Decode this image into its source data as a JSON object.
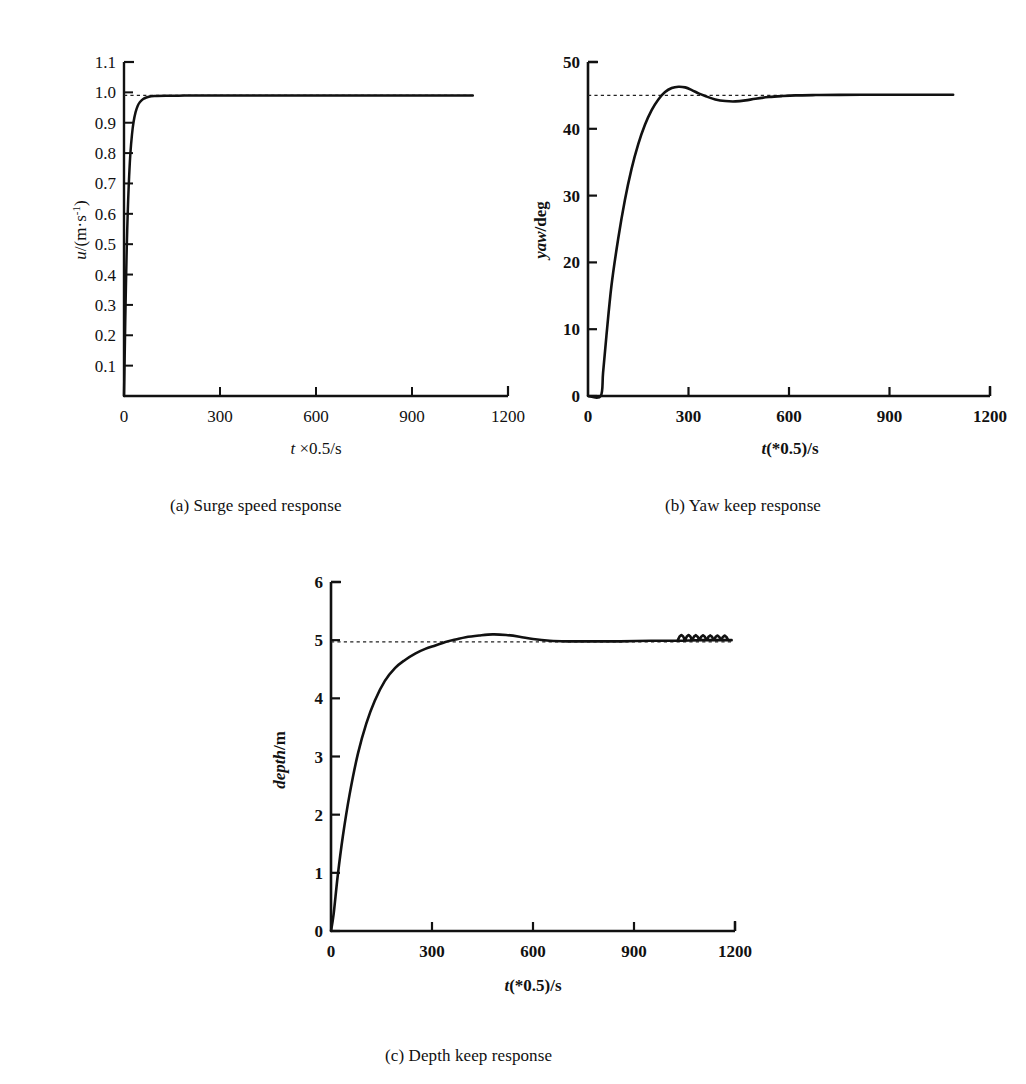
{
  "figure": {
    "background": "#ffffff",
    "ink_color": "#111111"
  },
  "captions": {
    "a": "(a) Surge speed response",
    "b": "(b) Yaw keep response",
    "c": "(c) Depth keep response"
  },
  "panel_a": {
    "ylabel_var": "u",
    "ylabel_unit": "/(m·s",
    "ylabel_exp": "-1",
    "ylabel_close": ")",
    "xlabel_var": "t",
    "xlabel_rest": " ×0.5/s",
    "xticks": [
      "0",
      "300",
      "600",
      "900",
      "1200"
    ],
    "yticks": [
      "0.1",
      "0.2",
      "0.3",
      "0.4",
      "0.5",
      "0.6",
      "0.7",
      "0.8",
      "0.9",
      "1.0",
      "1.1"
    ]
  },
  "panel_b": {
    "ylabel_var": "yaw",
    "ylabel_unit": "/deg",
    "xlabel_var": "t",
    "xlabel_rest": "(*0.5)/s",
    "xticks": [
      "0",
      "300",
      "600",
      "900",
      "1200"
    ],
    "yticks": [
      "0",
      "10",
      "20",
      "30",
      "40",
      "50"
    ]
  },
  "panel_c": {
    "ylabel_var": "depth",
    "ylabel_unit": "/m",
    "xlabel_var": "t",
    "xlabel_rest": "(*0.5)/s",
    "xticks": [
      "0",
      "300",
      "600",
      "900",
      "1200"
    ],
    "yticks": [
      "0",
      "1",
      "2",
      "3",
      "4",
      "5",
      "6"
    ]
  },
  "chart_data": [
    {
      "id": "surge-speed",
      "type": "line",
      "title": "(a) Surge speed response",
      "xlabel": "t ×0.5/s",
      "ylabel": "u/(m·s^-1)",
      "xlim": [
        0,
        1200
      ],
      "ylim": [
        0,
        1.1
      ],
      "xticks": [
        0,
        300,
        600,
        900,
        1200
      ],
      "yticks": [
        0.1,
        0.2,
        0.3,
        0.4,
        0.5,
        0.6,
        0.7,
        0.8,
        0.9,
        1.0,
        1.1
      ],
      "grid": false,
      "legend": "none",
      "reference_line": {
        "value": 0.99,
        "style": "dashed",
        "label": "setpoint"
      },
      "data_extent_x": [
        0,
        1090
      ],
      "series": [
        {
          "name": "u",
          "x": [
            0,
            2,
            4,
            6,
            8,
            10,
            13,
            16,
            20,
            25,
            30,
            36,
            43,
            50,
            60,
            70,
            85,
            100,
            130,
            170,
            220,
            300,
            400,
            500,
            600,
            700,
            800,
            900,
            1000,
            1090
          ],
          "y": [
            0.0,
            0.12,
            0.25,
            0.36,
            0.46,
            0.545,
            0.645,
            0.722,
            0.8,
            0.862,
            0.903,
            0.934,
            0.956,
            0.968,
            0.978,
            0.983,
            0.987,
            0.988,
            0.989,
            0.989,
            0.99,
            0.99,
            0.99,
            0.99,
            0.99,
            0.99,
            0.99,
            0.99,
            0.99,
            0.99
          ]
        }
      ]
    },
    {
      "id": "yaw-keep",
      "type": "line",
      "title": "(b) Yaw keep response",
      "xlabel": "t(*0.5)/s",
      "ylabel": "yaw/deg",
      "xlim": [
        0,
        1200
      ],
      "ylim": [
        0,
        50
      ],
      "xticks": [
        0,
        300,
        600,
        900,
        1200
      ],
      "yticks": [
        0,
        10,
        20,
        30,
        40,
        50
      ],
      "grid": false,
      "legend": "none",
      "reference_line": {
        "value": 45,
        "style": "dashed",
        "label": "setpoint"
      },
      "data_extent_x": [
        0,
        1090
      ],
      "series": [
        {
          "name": "yaw",
          "x": [
            0,
            38,
            45,
            55,
            70,
            90,
            110,
            130,
            150,
            170,
            190,
            210,
            230,
            250,
            270,
            290,
            310,
            330,
            350,
            380,
            410,
            440,
            470,
            500,
            540,
            580,
            620,
            680,
            750,
            850,
            950,
            1090
          ],
          "y": [
            0,
            0,
            3.5,
            9.0,
            16.5,
            23.5,
            29.3,
            34.0,
            37.7,
            40.6,
            42.8,
            44.4,
            45.5,
            46.1,
            46.3,
            46.2,
            45.8,
            45.3,
            44.9,
            44.4,
            44.15,
            44.1,
            44.25,
            44.5,
            44.75,
            44.9,
            45.0,
            45.05,
            45.08,
            45.1,
            45.1,
            45.1
          ]
        }
      ]
    },
    {
      "id": "depth-keep",
      "type": "line",
      "title": "(c) Depth keep response",
      "xlabel": "t(*0.5)/s",
      "ylabel": "depth/m",
      "xlim": [
        0,
        1200
      ],
      "ylim": [
        0,
        6
      ],
      "xticks": [
        0,
        300,
        600,
        900,
        1200
      ],
      "yticks": [
        0,
        1,
        2,
        3,
        4,
        5,
        6
      ],
      "grid": false,
      "legend": "none",
      "reference_line": {
        "value": 4.97,
        "style": "dashed",
        "label": "setpoint"
      },
      "data_extent_x": [
        0,
        1190
      ],
      "ripple": {
        "x_start": 1030,
        "x_end": 1180,
        "amplitude": 0.09,
        "count": 7
      },
      "series": [
        {
          "name": "depth",
          "x": [
            0,
            8,
            20,
            35,
            55,
            80,
            105,
            130,
            160,
            190,
            220,
            250,
            280,
            310,
            340,
            370,
            400,
            440,
            480,
            520,
            560,
            600,
            650,
            700,
            780,
            860,
            950,
            1030,
            1100,
            1190
          ],
          "y": [
            0.0,
            0.3,
            0.95,
            1.62,
            2.34,
            3.05,
            3.57,
            3.96,
            4.3,
            4.52,
            4.66,
            4.77,
            4.85,
            4.91,
            4.97,
            5.01,
            5.05,
            5.08,
            5.1,
            5.09,
            5.06,
            5.02,
            4.99,
            4.98,
            4.98,
            4.98,
            4.99,
            4.99,
            5.0,
            5.0
          ]
        }
      ]
    }
  ]
}
